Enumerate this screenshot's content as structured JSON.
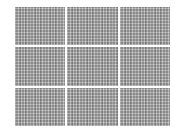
{
  "layout": {
    "rows": 3,
    "columns": 3
  },
  "panels": [
    {
      "row": 1,
      "col": 1,
      "pattern": "gray-mesh"
    },
    {
      "row": 1,
      "col": 2,
      "pattern": "gray-mesh"
    },
    {
      "row": 1,
      "col": 3,
      "pattern": "gray-mesh"
    },
    {
      "row": 2,
      "col": 1,
      "pattern": "gray-mesh"
    },
    {
      "row": 2,
      "col": 2,
      "pattern": "gray-mesh"
    },
    {
      "row": 2,
      "col": 3,
      "pattern": "gray-mesh"
    },
    {
      "row": 3,
      "col": 1,
      "pattern": "gray-mesh"
    },
    {
      "row": 3,
      "col": 2,
      "pattern": "gray-mesh"
    },
    {
      "row": 3,
      "col": 3,
      "pattern": "gray-mesh"
    }
  ],
  "colors": {
    "panel": "#8a8a8a",
    "background": "#ffffff"
  }
}
